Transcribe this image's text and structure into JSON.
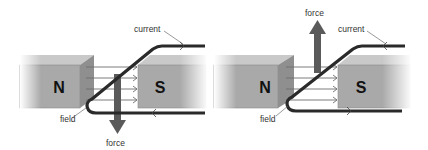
{
  "diagram": {
    "colors": {
      "background": "#ffffff",
      "magnet_front": "#a9a9a9",
      "magnet_top": "#c9c9c9",
      "magnet_side": "#8f8f8f",
      "wire": "#2a2a2a",
      "field_line": "#6e6e6e",
      "force_arrow": "#5a5a5a",
      "label_text": "#333333",
      "pole_text": "#111111"
    },
    "panels": [
      {
        "id": "left",
        "north_label": "N",
        "south_label": "S",
        "current_label": "current",
        "field_label": "field",
        "force_label": "force",
        "force_direction": "down",
        "current_arrow_top": "right",
        "current_arrow_bottom": "left"
      },
      {
        "id": "right",
        "north_label": "N",
        "south_label": "S",
        "current_label": "current",
        "field_label": "field",
        "force_label": "force",
        "force_direction": "up",
        "current_arrow_top": "left",
        "current_arrow_bottom": "right"
      }
    ]
  }
}
